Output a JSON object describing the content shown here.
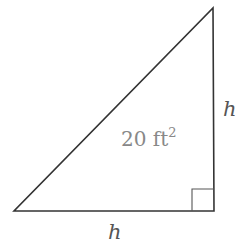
{
  "diagram": {
    "type": "right-triangle",
    "vertices": {
      "bottom_left": [
        14,
        211
      ],
      "bottom_right": [
        214,
        211
      ],
      "top_right": [
        213,
        8
      ]
    },
    "right_angle_marker": {
      "x": 192,
      "y": 189,
      "size": 22
    },
    "labels": {
      "vertical_side": "h",
      "horizontal_side": "h",
      "area_value": "20 ft",
      "area_exponent": "2"
    },
    "colors": {
      "stroke": "#333333",
      "area_text": "#888888",
      "side_text": "#555555"
    }
  }
}
